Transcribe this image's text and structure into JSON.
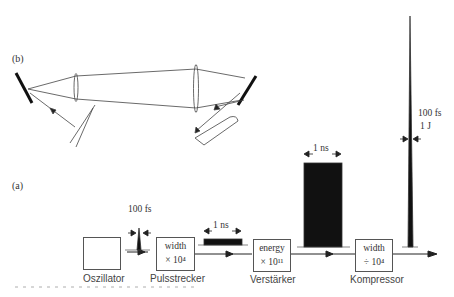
{
  "panels": {
    "b": {
      "label": "(b)"
    },
    "a": {
      "label": "(a)"
    }
  },
  "components": [
    {
      "name": "Oszillator",
      "line1": "",
      "line2": ""
    },
    {
      "name": "Pulsstrecker",
      "line1": "width",
      "line2": "× 10⁴"
    },
    {
      "name": "Verstärker",
      "line1": "energy",
      "line2": "× 10¹¹"
    },
    {
      "name": "Kompressor",
      "line1": "width",
      "line2": "÷ 10⁴"
    }
  ],
  "pulse_annotations": {
    "oscillator_out": "100 fs",
    "stretched": "1 ns",
    "amplified": "1 ns",
    "compressed_width": "100 fs",
    "compressed_energy": "1 J"
  },
  "colors": {
    "ink": "#111111",
    "line": "#555555",
    "text": "#444444"
  }
}
